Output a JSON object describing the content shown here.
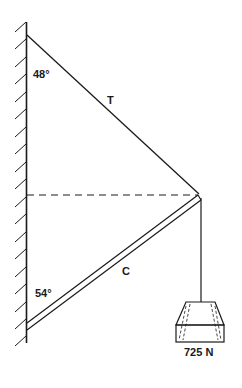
{
  "diagram": {
    "type": "statics-free-body",
    "labels": {
      "cable": "T",
      "strut": "C",
      "cable_angle": "48°",
      "strut_angle": "54°",
      "weight": "725 N"
    },
    "colors": {
      "stroke": "#1a1a1a",
      "background": "#ffffff"
    }
  }
}
